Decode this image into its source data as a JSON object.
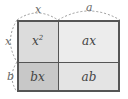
{
  "diagram": {
    "top_dimensions": [
      {
        "label": "x"
      },
      {
        "label": "a"
      }
    ],
    "left_dimensions": [
      {
        "label": "x"
      },
      {
        "label": "b"
      }
    ],
    "cells": [
      {
        "label": "x",
        "sup": "2",
        "fill": "#dcdcdc"
      },
      {
        "label": "ax",
        "fill": "#ececec"
      },
      {
        "label": "bx",
        "fill": "#c8c8c8"
      },
      {
        "label": "ab",
        "fill": "#e4e4e4"
      }
    ],
    "colors": {
      "border": "#555555",
      "dashed_arc": "#999999",
      "text": "#444444"
    }
  }
}
